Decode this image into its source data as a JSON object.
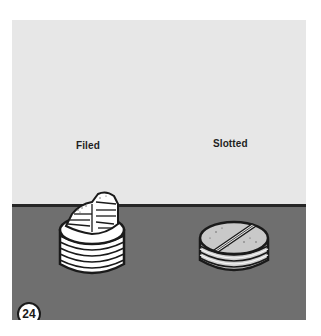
{
  "figure": {
    "number": "24",
    "labels": {
      "left": "Filed",
      "right": "Slotted"
    },
    "items": [
      {
        "name": "filed-plug",
        "label": "Filed",
        "fill": "#ffffff"
      },
      {
        "name": "slotted-plug",
        "label": "Slotted",
        "fill": "#cfcfcf"
      }
    ],
    "colors": {
      "backdrop": "#e7e7e7",
      "floor": "#6f6f6f",
      "horizon": "#262626",
      "outline": "#1a1a1a"
    }
  }
}
